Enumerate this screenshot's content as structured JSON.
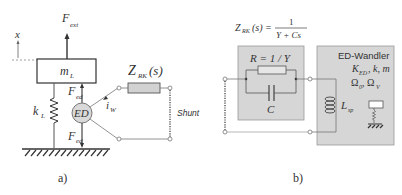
{
  "figure": {
    "panel_a": {
      "caption": "a)",
      "labels": {
        "x_axis": "x",
        "force_ext": "F",
        "force_ext_sub": "ext",
        "mass": "m",
        "mass_sub": "L",
        "spring": "k",
        "spring_sub": "L",
        "force_ed_top": "F",
        "force_ed_top_sub": "ed",
        "force_ed_bottom": "F",
        "force_ed_bottom_sub": "ed",
        "transducer": "ED",
        "current": "i",
        "current_sub": "W",
        "impedance": "Z",
        "impedance_sub": "RK",
        "impedance_arg": "(s)",
        "shunt": "Shunt"
      }
    },
    "panel_b": {
      "caption": "b)",
      "formula": {
        "lhs": "Z",
        "lhs_sub": "RK",
        "lhs_arg": "(s) =",
        "numerator": "1",
        "denominator": "Y + Cs"
      },
      "rc_box": {
        "resistor_label": "R = 1 / Y",
        "capacitor_label": "C"
      },
      "transducer_box": {
        "title": "ED-Wandler",
        "params_line1": "K",
        "params_line1_sub": "ED",
        "params_line1_rest": ", k, m",
        "params_line2": "Ω",
        "params_line2_sub1": "0",
        "params_line2_mid": ", Ω",
        "params_line2_sub2": "V",
        "inductor": "L",
        "inductor_sub": "sp"
      }
    },
    "colors": {
      "line": "#444444",
      "box_fill": "#d6d6d6",
      "box_stroke": "#9a9a9a",
      "wire": "#777777"
    }
  }
}
